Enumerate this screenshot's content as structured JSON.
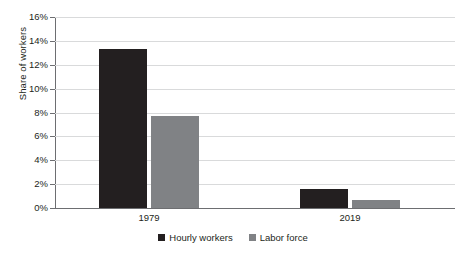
{
  "chart_data": {
    "type": "bar",
    "title": "",
    "xlabel": "",
    "ylabel": "Share of workers",
    "categories": [
      "1979",
      "2019"
    ],
    "series": [
      {
        "name": "Hourly workers",
        "color": "#231f20",
        "values": [
          13.3,
          1.6
        ]
      },
      {
        "name": "Labor force",
        "color": "#808285",
        "values": [
          7.7,
          0.7
        ]
      }
    ],
    "ylim": [
      0,
      16
    ],
    "ytick_step": 2,
    "ytick_labels": [
      "0%",
      "2%",
      "4%",
      "6%",
      "8%",
      "10%",
      "12%",
      "14%",
      "16%"
    ],
    "ytick_values": [
      0,
      2,
      4,
      6,
      8,
      10,
      12,
      14,
      16
    ],
    "grid": true,
    "grid_axis": "y",
    "legend_position": "bottom",
    "value_format": "percent"
  },
  "colors": {
    "series_dark": "#231f20",
    "series_light": "#808285",
    "gridline": "#d9dadb",
    "axis": "#6d6e71",
    "background": "#ffffff"
  }
}
